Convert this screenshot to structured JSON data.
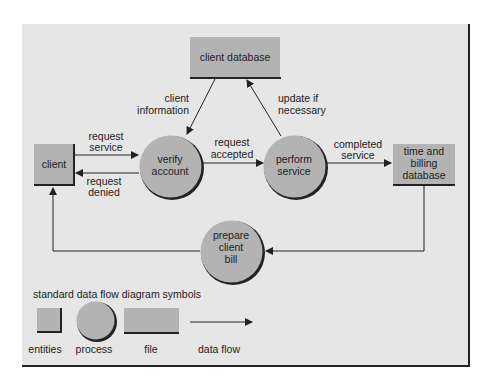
{
  "diagram": {
    "entities": {
      "client": "client",
      "client_database": "client database",
      "time_billing_database": [
        "time and",
        "billing",
        "database"
      ]
    },
    "processes": {
      "verify_account": [
        "verify",
        "account"
      ],
      "perform_service": [
        "perform",
        "service"
      ],
      "prepare_client_bill": [
        "prepare",
        "client",
        "bill"
      ]
    },
    "flows": {
      "request_service": [
        "request",
        "service"
      ],
      "request_denied": [
        "request",
        "denied"
      ],
      "request_accepted": [
        "request",
        "accepted"
      ],
      "completed_service": [
        "completed",
        "service"
      ],
      "client_information": [
        "client",
        "information"
      ],
      "update_if_necessary": [
        "update if",
        "necessary"
      ]
    },
    "legend": {
      "title": "standard data flow diagram symbols",
      "entities": "entities",
      "process": "process",
      "file": "file",
      "data_flow": "data flow"
    }
  }
}
